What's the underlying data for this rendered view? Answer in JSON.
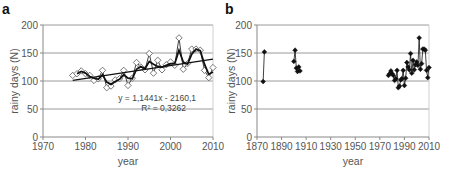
{
  "chart_data": [
    {
      "panel": "a",
      "type": "line",
      "title": "",
      "xlabel": "year",
      "ylabel": "rainy days (N)",
      "xlim": [
        1970,
        2010
      ],
      "ylim": [
        0,
        200
      ],
      "xticks": [
        1970,
        1980,
        1990,
        2000,
        2010
      ],
      "yticks": [
        0,
        50,
        100,
        150,
        200
      ],
      "grid": "horizontal",
      "legend": "none",
      "annotation": {
        "equation": "y = 1,1441x - 2160,1",
        "r_squared": "R² = 0,3262"
      },
      "series": [
        {
          "name": "annual rainy days",
          "style": "open diamond markers, thin line",
          "x": [
            1977,
            1978,
            1979,
            1980,
            1981,
            1982,
            1983,
            1984,
            1985,
            1986,
            1987,
            1988,
            1989,
            1990,
            1991,
            1992,
            1993,
            1994,
            1995,
            1996,
            1997,
            1998,
            1999,
            2000,
            2001,
            2002,
            2003,
            2004,
            2005,
            2006,
            2007,
            2008,
            2009,
            2010
          ],
          "values": [
            110,
            113,
            118,
            113,
            110,
            101,
            104,
            119,
            88,
            91,
            102,
            104,
            119,
            92,
            105,
            133,
            125,
            120,
            149,
            114,
            137,
            120,
            129,
            134,
            128,
            177,
            121,
            131,
            157,
            157,
            155,
            119,
            106,
            124
          ]
        },
        {
          "name": "moving average",
          "style": "thick black line",
          "x": [
            1978,
            1979,
            1980,
            1981,
            1982,
            1983,
            1984,
            1985,
            1986,
            1987,
            1988,
            1989,
            1990,
            1991,
            1992,
            1993,
            1994,
            1995,
            1996,
            1997,
            1998,
            1999,
            2000,
            2001,
            2002,
            2003,
            2004,
            2005,
            2006,
            2007,
            2008,
            2009,
            2010
          ],
          "values": [
            113,
            117,
            114,
            108,
            105,
            103,
            111,
            98,
            94,
            99,
            103,
            111,
            105,
            104,
            121,
            126,
            122,
            135,
            130,
            126,
            125,
            128,
            131,
            131,
            155,
            134,
            130,
            148,
            157,
            154,
            130,
            112,
            116
          ]
        },
        {
          "name": "linear trend",
          "style": "straight black line",
          "x": [
            1977,
            2010
          ],
          "values": [
            101.3,
            139.1
          ]
        }
      ]
    },
    {
      "panel": "b",
      "type": "line",
      "title": "",
      "xlabel": "year",
      "ylabel": "rainy days (N)",
      "xlim": [
        1870,
        2010
      ],
      "ylim": [
        0,
        200
      ],
      "xticks": [
        1870,
        1890,
        1910,
        1930,
        1950,
        1970,
        1990,
        2010
      ],
      "yticks": [
        0,
        50,
        100,
        150,
        200
      ],
      "grid": "horizontal",
      "legend": "none",
      "series": [
        {
          "name": "annual rainy days (1870s)",
          "style": "filled diamond markers, thin line",
          "x": [
            1875,
            1876
          ],
          "values": [
            99,
            152
          ]
        },
        {
          "name": "annual rainy days (1900s)",
          "style": "filled diamond markers, thin line",
          "x": [
            1900,
            1901,
            1902,
            1903,
            1904,
            1905
          ],
          "values": [
            135,
            155,
            123,
            117,
            125,
            118
          ]
        },
        {
          "name": "annual rainy days (1977-2010)",
          "style": "filled diamond markers, thin line",
          "x": [
            1977,
            1978,
            1979,
            1980,
            1981,
            1982,
            1983,
            1984,
            1985,
            1986,
            1987,
            1988,
            1989,
            1990,
            1991,
            1992,
            1993,
            1994,
            1995,
            1996,
            1997,
            1998,
            1999,
            2000,
            2001,
            2002,
            2003,
            2004,
            2005,
            2006,
            2007,
            2008,
            2009,
            2010
          ],
          "values": [
            110,
            113,
            118,
            113,
            110,
            101,
            104,
            119,
            88,
            91,
            102,
            104,
            119,
            92,
            105,
            133,
            125,
            120,
            149,
            114,
            137,
            120,
            129,
            134,
            128,
            177,
            121,
            131,
            157,
            157,
            155,
            119,
            106,
            124
          ]
        }
      ]
    }
  ],
  "panels": {
    "a": {
      "label": "a",
      "xlabel": "year",
      "ylabel": "rainy days (N)",
      "equation": "y = 1,1441x - 2160,1",
      "r2": "R² = 0,3262"
    },
    "b": {
      "label": "b",
      "xlabel": "year",
      "ylabel": "rainy days (N)"
    }
  },
  "colors": {
    "line": "#111111",
    "grid": "#9a9a9a",
    "text": "#555555",
    "marker_open_fill": "#ffffff",
    "marker_filled": "#111111"
  }
}
